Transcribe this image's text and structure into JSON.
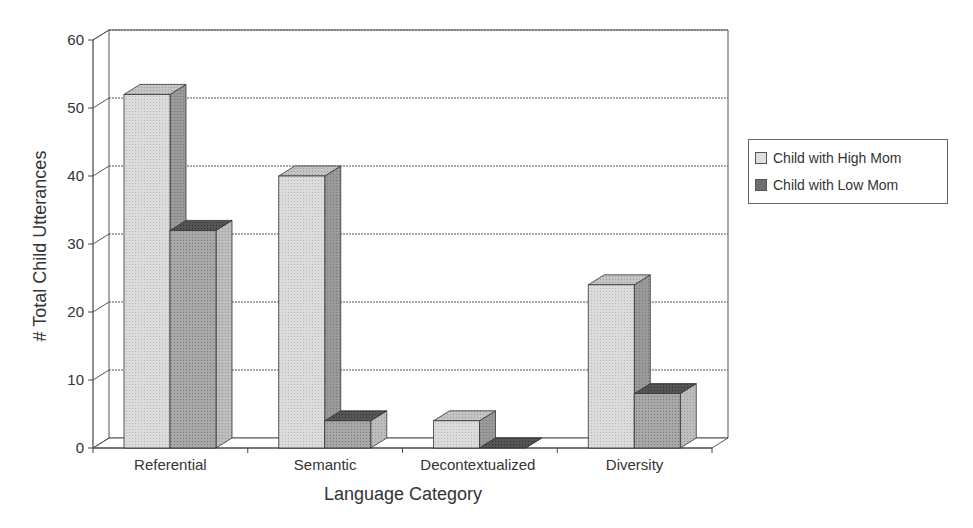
{
  "chart_data": {
    "type": "bar",
    "style": "3d-clustered",
    "title": "",
    "xlabel": "Language Category",
    "ylabel": "# Total Child Utterances",
    "categories": [
      "Referential",
      "Semantic",
      "Decontextualized",
      "Diversity"
    ],
    "series": [
      {
        "name": "Child with High Mom",
        "values": [
          52,
          40,
          4,
          24
        ],
        "color": "#d9d9d9"
      },
      {
        "name": "Child with Low Mom",
        "values": [
          32,
          4,
          0,
          8
        ],
        "color": "#8c8c8c"
      }
    ],
    "ylim": [
      0,
      60
    ],
    "yticks": [
      "0",
      "10",
      "20",
      "30",
      "40",
      "50",
      "60"
    ],
    "grid": true,
    "legend_position": "right"
  },
  "legend": {
    "items": [
      {
        "label": "Child with High Mom",
        "color": "#d9d9d9"
      },
      {
        "label": "Child with Low Mom",
        "color": "#6f6f6f"
      }
    ]
  }
}
